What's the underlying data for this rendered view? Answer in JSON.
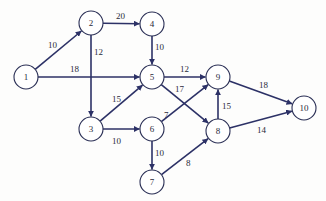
{
  "diagram": {
    "type": "directed-weighted-network",
    "colors": {
      "edge": "#2c3166",
      "node_stroke": "#2a2f55",
      "text": "#2a2a3a",
      "background": "#fdfdfc"
    },
    "nodes": [
      {
        "id": "1",
        "label": "1",
        "x": 26,
        "y": 77
      },
      {
        "id": "2",
        "label": "2",
        "x": 91,
        "y": 23
      },
      {
        "id": "3",
        "label": "3",
        "x": 91,
        "y": 129
      },
      {
        "id": "4",
        "label": "4",
        "x": 152,
        "y": 24
      },
      {
        "id": "5",
        "label": "5",
        "x": 152,
        "y": 77
      },
      {
        "id": "6",
        "label": "6",
        "x": 152,
        "y": 129
      },
      {
        "id": "7",
        "label": "7",
        "x": 152,
        "y": 182
      },
      {
        "id": "8",
        "label": "8",
        "x": 218,
        "y": 131
      },
      {
        "id": "9",
        "label": "9",
        "x": 218,
        "y": 77
      },
      {
        "id": "10",
        "label": "10",
        "x": 304,
        "y": 108
      }
    ],
    "edges": [
      {
        "from": "1",
        "to": "2",
        "weight": "10",
        "lx": 48,
        "ly": 48
      },
      {
        "from": "1",
        "to": "5",
        "weight": "18",
        "lx": 70,
        "ly": 72
      },
      {
        "from": "2",
        "to": "4",
        "weight": "20",
        "lx": 116,
        "ly": 19
      },
      {
        "from": "2",
        "to": "3",
        "weight": "12",
        "lx": 94,
        "ly": 55
      },
      {
        "from": "4",
        "to": "5",
        "weight": "10",
        "lx": 155,
        "ly": 50
      },
      {
        "from": "3",
        "to": "5",
        "weight": "15",
        "lx": 112,
        "ly": 102
      },
      {
        "from": "3",
        "to": "6",
        "weight": "10",
        "lx": 112,
        "ly": 144
      },
      {
        "from": "5",
        "to": "9",
        "weight": "12",
        "lx": 180,
        "ly": 72
      },
      {
        "from": "5",
        "to": "8",
        "weight": "17",
        "lx": 175,
        "ly": 92
      },
      {
        "from": "6",
        "to": "9",
        "weight": "7",
        "lx": 164,
        "ly": 118
      },
      {
        "from": "6",
        "to": "7",
        "weight": "10",
        "lx": 155,
        "ly": 156
      },
      {
        "from": "7",
        "to": "8",
        "weight": "8",
        "lx": 186,
        "ly": 166
      },
      {
        "from": "8",
        "to": "9",
        "weight": "15",
        "lx": 222,
        "ly": 109
      },
      {
        "from": "9",
        "to": "10",
        "weight": "18",
        "lx": 259,
        "ly": 88
      },
      {
        "from": "8",
        "to": "10",
        "weight": "14",
        "lx": 257,
        "ly": 133
      }
    ]
  }
}
